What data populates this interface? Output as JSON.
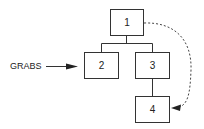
{
  "diagram": {
    "nodes": [
      {
        "id": "1",
        "label": "1"
      },
      {
        "id": "2",
        "label": "2"
      },
      {
        "id": "3",
        "label": "3"
      },
      {
        "id": "4",
        "label": "4"
      }
    ],
    "edges": [
      {
        "from": "1",
        "to": "2",
        "style": "solid"
      },
      {
        "from": "1",
        "to": "3",
        "style": "solid"
      },
      {
        "from": "3",
        "to": "4",
        "style": "solid"
      },
      {
        "from": "1",
        "to": "4",
        "style": "dashed-arrow"
      }
    ],
    "external_label": "GRABS",
    "external_arrow_target": "2"
  }
}
